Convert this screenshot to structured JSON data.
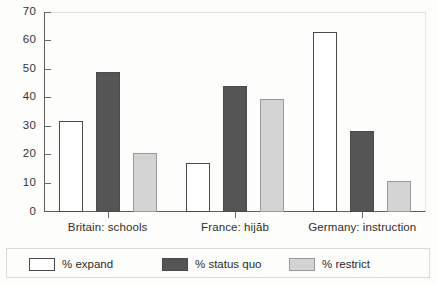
{
  "chart_data": {
    "type": "bar",
    "title": "",
    "subtitle": "",
    "xlabel": "",
    "ylabel": "",
    "ylim": [
      0,
      70
    ],
    "ytick_values": [
      0,
      10,
      20,
      30,
      40,
      50,
      60,
      70
    ],
    "ytick_labels": [
      "0",
      "10",
      "20",
      "30",
      "40",
      "50",
      "60",
      "70"
    ],
    "grid": false,
    "legend_position": "bottom",
    "categories": [
      "Britain: schools",
      "France: hijăb",
      "Germany: instruction"
    ],
    "series": [
      {
        "name": "% expand",
        "color": "#ffffff",
        "edge": "#4a4a4a",
        "values": [
          32,
          17,
          63
        ]
      },
      {
        "name": "% status quo",
        "color": "#555555",
        "edge": "#4a4a4a",
        "values": [
          49,
          44,
          28.5
        ]
      },
      {
        "name": "% restrict",
        "color": "#d4d4d4",
        "edge": "#9a9a9a",
        "values": [
          20.5,
          39.5,
          11
        ]
      }
    ]
  },
  "axis": {
    "y_labels": [
      "70",
      "60",
      "50",
      "40",
      "30",
      "20",
      "10",
      "0"
    ],
    "x_labels": [
      "Britain: schools",
      "France: hijăb",
      "Germany: instruction"
    ]
  },
  "legend": {
    "items": [
      {
        "label": "% expand"
      },
      {
        "label": "% status quo"
      },
      {
        "label": "% restrict"
      }
    ]
  },
  "colors": {
    "expand": "#ffffff",
    "status_quo": "#555555",
    "restrict": "#d4d4d4",
    "axis": "#5e5e5e",
    "text": "#2e2e2e",
    "background": "#fdfdfc"
  }
}
